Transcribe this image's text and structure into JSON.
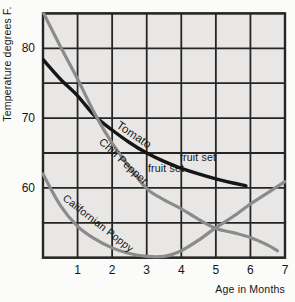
{
  "colors": {
    "page_bg": "#fbfbfa",
    "plot_bg": "#e8e7e5",
    "grid": "#262626",
    "tomato_curve": "#161616",
    "gray_curve": "#8b8b8b",
    "text": "#151515"
  },
  "chart_data": {
    "type": "line",
    "title": "",
    "xlabel": "Age in Months",
    "ylabel": "Temperature degrees F.",
    "xlim": [
      0,
      7
    ],
    "ylim": [
      50,
      85
    ],
    "grid": {
      "x_step": 1,
      "y_step": 5,
      "visible": true
    },
    "x_ticks": [
      "1",
      "2",
      "3",
      "4",
      "5",
      "6",
      "7"
    ],
    "y_ticks": [
      "80",
      "70",
      "60"
    ],
    "series": [
      {
        "name": "Tomato",
        "color": "#161616",
        "width": 3.4,
        "points": [
          [
            0,
            78.4
          ],
          [
            0.5,
            75.6
          ],
          [
            1,
            73.2
          ],
          [
            1.5,
            70.3
          ],
          [
            2,
            68.3
          ],
          [
            2.5,
            66.5
          ],
          [
            3,
            65.0
          ],
          [
            3.5,
            63.8
          ],
          [
            4,
            62.8
          ],
          [
            4.5,
            62.0
          ],
          [
            5,
            61.3
          ],
          [
            5.5,
            60.7
          ],
          [
            5.87,
            60.3
          ]
        ]
      },
      {
        "name": "Chili Pepper",
        "color": "#8b8b8b",
        "width": 3.2,
        "points": [
          [
            0,
            85.2
          ],
          [
            0.5,
            80.3
          ],
          [
            1,
            75.6
          ],
          [
            1.5,
            70.6
          ],
          [
            2,
            66.4
          ],
          [
            2.5,
            63.0
          ],
          [
            3,
            59.9
          ],
          [
            3.5,
            58.3
          ],
          [
            4,
            57.0
          ],
          [
            4.5,
            55.5
          ],
          [
            5,
            54.2
          ],
          [
            5.5,
            53.6
          ],
          [
            6,
            52.9
          ],
          [
            6.5,
            51.8
          ],
          [
            6.78,
            51.0
          ]
        ]
      },
      {
        "name": "Californian Poppy",
        "color": "#8b8b8b",
        "width": 3.2,
        "points": [
          [
            0,
            62.0
          ],
          [
            0.5,
            57.5
          ],
          [
            1,
            54.5
          ],
          [
            1.5,
            52.7
          ],
          [
            2,
            51.4
          ],
          [
            2.5,
            50.6
          ],
          [
            3,
            50.2
          ],
          [
            3.5,
            50.2
          ],
          [
            4,
            51.0
          ],
          [
            4.5,
            52.5
          ],
          [
            5,
            54.3
          ],
          [
            5.5,
            55.9
          ],
          [
            6,
            57.7
          ],
          [
            6.5,
            59.3
          ],
          [
            7,
            60.9
          ]
        ]
      }
    ],
    "annotations": [
      {
        "name": "tomato-curve-label",
        "text": "Tomato",
        "x": 132,
        "y": 138,
        "rotate": 34,
        "size": 11.5
      },
      {
        "name": "chili-pepper-curve-label",
        "text": "Chili Pepper",
        "x": 121,
        "y": 164,
        "rotate": 43,
        "size": 11
      },
      {
        "name": "tomato-fruit-set-label",
        "text": "fruit set",
        "x": 198,
        "y": 161,
        "rotate": 0,
        "size": 10.5
      },
      {
        "name": "chili-fruit-set-label",
        "text": "fruit set",
        "x": 166,
        "y": 172,
        "rotate": 0,
        "size": 10.5
      },
      {
        "name": "californian-poppy-curve-label",
        "text": "Californian Poppy",
        "x": 96,
        "y": 226,
        "rotate": 38,
        "size": 10.5
      }
    ]
  }
}
